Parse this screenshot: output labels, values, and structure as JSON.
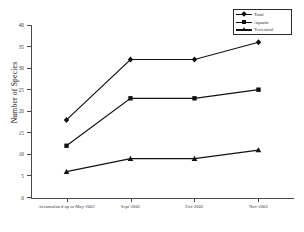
{
  "chart_data": {
    "type": "line",
    "title": "",
    "xlabel": "",
    "ylabel": "Number of Species",
    "ylim": [
      0,
      40
    ],
    "ytick_step": 5,
    "yticks": [
      40,
      35,
      30,
      25,
      20,
      15,
      10,
      5,
      0
    ],
    "grid": false,
    "legend_position": "top-right",
    "categories": [
      "Accumulated up to May-2002",
      "Sept-2002",
      "Oct-2002",
      "Nov-2002"
    ],
    "series": [
      {
        "name": "Total",
        "marker": "diamond",
        "color": "#111111",
        "values": [
          18,
          32,
          32,
          36
        ]
      },
      {
        "name": "Aquatic",
        "marker": "square",
        "color": "#111111",
        "values": [
          12,
          23,
          23,
          25
        ]
      },
      {
        "name": "Terrestrial",
        "marker": "triangle",
        "color": "#111111",
        "values": [
          6,
          9,
          9,
          11
        ]
      }
    ]
  },
  "legend": {
    "items": [
      {
        "label": "Total"
      },
      {
        "label": "Aquatic"
      },
      {
        "label": "Terrestrial"
      }
    ]
  },
  "axes": {
    "y_title": "Number of Species",
    "y_labels": [
      "40",
      "35",
      "30",
      "25",
      "20",
      "15",
      "10",
      "5",
      "0"
    ],
    "x_labels": [
      "Accumulated up to May-2002",
      "Sept-2002",
      "Oct-2002",
      "Nov-2002"
    ]
  }
}
